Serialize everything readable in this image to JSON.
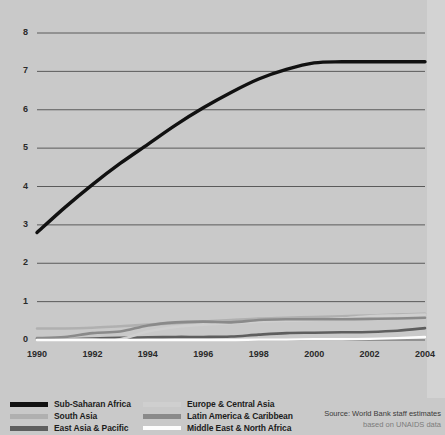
{
  "source_note": {
    "line1": "Source: World Bank staff estimates",
    "line2": "based on UNAIDS data"
  },
  "axes": {
    "y_ticks": [
      "0",
      "1",
      "2",
      "3",
      "4",
      "5",
      "6",
      "7",
      "8"
    ],
    "x_ticks": [
      "1990",
      "1992",
      "1994",
      "1996",
      "1998",
      "2000",
      "2002",
      "2004"
    ]
  },
  "legend": {
    "column1": [
      {
        "label": "Sub-Saharan Africa",
        "color": "#111111"
      },
      {
        "label": "South Asia",
        "color": "#b0b0b0"
      },
      {
        "label": "East Asia & Pacific",
        "color": "#5e5e5e"
      }
    ],
    "column2": [
      {
        "label": "Europe & Central Asia",
        "color": "#cfcfcf"
      },
      {
        "label": "Latin America & Caribbean",
        "color": "#8a8a8a"
      },
      {
        "label": "Middle East & North Africa",
        "color": "#fdfdfd"
      }
    ]
  },
  "chart_data": {
    "type": "line",
    "title": "",
    "subtitle": "",
    "xlabel": "",
    "ylabel": "",
    "xlim": [
      1990,
      2004
    ],
    "ylim": [
      0,
      8
    ],
    "grid": true,
    "grid_axis": "y",
    "legend_position": "bottom-left",
    "x": [
      1990,
      1991,
      1992,
      1993,
      1994,
      1995,
      1996,
      1997,
      1998,
      1999,
      2000,
      2001,
      2002,
      2003,
      2004
    ],
    "series": [
      {
        "name": "Sub-Saharan Africa",
        "color": "#111111",
        "width": 3.4,
        "values": [
          2.8,
          3.45,
          4.05,
          4.6,
          5.1,
          5.6,
          6.05,
          6.45,
          6.8,
          7.05,
          7.22,
          7.25,
          7.25,
          7.25,
          7.25
        ]
      },
      {
        "name": "South Asia",
        "color": "#b0b0b0",
        "width": 2.6,
        "values": [
          0.3,
          0.3,
          0.32,
          0.36,
          0.4,
          0.44,
          0.48,
          0.52,
          0.56,
          0.58,
          0.6,
          0.62,
          0.64,
          0.66,
          0.68
        ]
      },
      {
        "name": "East Asia & Pacific",
        "color": "#5e5e5e",
        "width": 2.6,
        "values": [
          0.03,
          0.02,
          0.04,
          0.06,
          0.07,
          0.08,
          0.08,
          0.09,
          0.14,
          0.18,
          0.19,
          0.2,
          0.21,
          0.24,
          0.31
        ]
      },
      {
        "name": "Europe & Central Asia",
        "color": "#cfcfcf",
        "width": 2.6,
        "values": [
          0.01,
          0.01,
          0.01,
          0.02,
          0.22,
          0.34,
          0.4,
          0.44,
          0.48,
          0.5,
          0.52,
          0.56,
          0.62,
          0.64,
          0.66
        ]
      },
      {
        "name": "Latin America & Caribbean",
        "color": "#8a8a8a",
        "width": 2.6,
        "values": [
          0.05,
          0.08,
          0.18,
          0.22,
          0.38,
          0.46,
          0.48,
          0.46,
          0.52,
          0.54,
          0.54,
          0.54,
          0.55,
          0.56,
          0.58
        ]
      },
      {
        "name": "Middle East & North Africa",
        "color": "#fdfdfd",
        "width": 2.4,
        "values": [
          0.0,
          0.0,
          0.0,
          0.0,
          0.0,
          0.0,
          0.0,
          0.0,
          0.01,
          0.01,
          0.02,
          0.02,
          0.03,
          0.05,
          0.08
        ]
      }
    ]
  }
}
